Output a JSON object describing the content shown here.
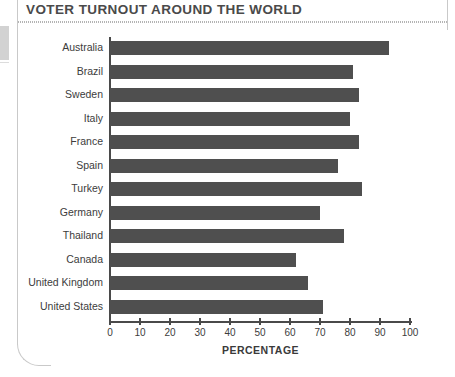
{
  "page": {
    "title": "VOTER TURNOUT AROUND THE WORLD"
  },
  "chart_data": {
    "type": "bar",
    "orientation": "horizontal",
    "title": "VOTER TURNOUT AROUND THE WORLD",
    "xlabel": "PERCENTAGE",
    "ylabel": "",
    "xlim": [
      0,
      100
    ],
    "xticks": [
      0,
      10,
      20,
      30,
      40,
      50,
      60,
      70,
      80,
      90,
      100
    ],
    "grid": false,
    "legend": false,
    "bar_color": "#4f4f4f",
    "axis_color": "#4a4a4a",
    "categories": [
      "Australia",
      "Brazil",
      "Sweden",
      "Italy",
      "France",
      "Spain",
      "Turkey",
      "Germany",
      "Thailand",
      "Canada",
      "United Kingdom",
      "United States"
    ],
    "values": [
      93,
      81,
      83,
      80,
      83,
      76,
      84,
      70,
      78,
      62,
      66,
      71
    ]
  }
}
